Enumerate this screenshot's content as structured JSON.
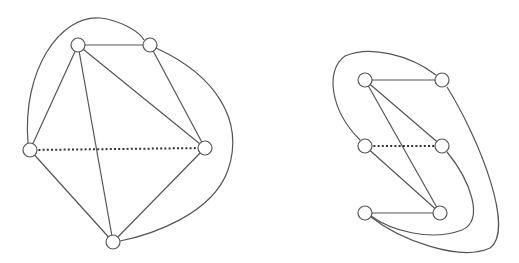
{
  "colors": {
    "edge": "#555555",
    "node_fill": "#ffffff",
    "dotted": "#333333",
    "background": "#ffffff"
  },
  "graphs": [
    {
      "name": "left-graph",
      "node_radius": 7,
      "nodes": [
        {
          "id": "a",
          "x": 78,
          "y": 45
        },
        {
          "id": "b",
          "x": 150,
          "y": 45
        },
        {
          "id": "c",
          "x": 30,
          "y": 150
        },
        {
          "id": "d",
          "x": 205,
          "y": 148
        },
        {
          "id": "e",
          "x": 113,
          "y": 242
        }
      ],
      "edges": [
        {
          "from": "a",
          "to": "b",
          "style": "solid"
        },
        {
          "from": "a",
          "to": "c",
          "style": "solid"
        },
        {
          "from": "a",
          "to": "d",
          "style": "solid"
        },
        {
          "from": "a",
          "to": "e",
          "style": "solid"
        },
        {
          "from": "b",
          "to": "d",
          "style": "solid"
        },
        {
          "from": "c",
          "to": "e",
          "style": "solid"
        },
        {
          "from": "d",
          "to": "e",
          "style": "solid"
        },
        {
          "from": "c",
          "to": "d",
          "style": "dotted"
        },
        {
          "from": "c",
          "to": "b",
          "style": "curve",
          "path": "M 28 143 C 22 70, 60 15, 100 18 C 120 20, 140 32, 144 40"
        },
        {
          "from": "b",
          "to": "e",
          "style": "curve",
          "path": "M 156 48 C 215 75, 245 120, 228 170 C 212 215, 150 235, 120 241"
        }
      ]
    },
    {
      "name": "right-graph",
      "node_radius": 7,
      "nodes": [
        {
          "id": "p",
          "x": 365,
          "y": 80
        },
        {
          "id": "q",
          "x": 442,
          "y": 80
        },
        {
          "id": "r",
          "x": 365,
          "y": 146
        },
        {
          "id": "s",
          "x": 442,
          "y": 146
        },
        {
          "id": "t",
          "x": 365,
          "y": 213
        },
        {
          "id": "u",
          "x": 440,
          "y": 213
        }
      ],
      "edges": [
        {
          "from": "p",
          "to": "q",
          "style": "solid"
        },
        {
          "from": "p",
          "to": "s",
          "style": "solid"
        },
        {
          "from": "p",
          "to": "u",
          "style": "solid"
        },
        {
          "from": "r",
          "to": "u",
          "style": "solid"
        },
        {
          "from": "t",
          "to": "u",
          "style": "solid"
        },
        {
          "from": "r",
          "to": "s",
          "style": "dotted"
        },
        {
          "from": "r",
          "to": "q",
          "style": "curve",
          "path": "M 360 140 C 330 110, 325 70, 345 56 C 370 45, 410 55, 436 75"
        },
        {
          "from": "s",
          "to": "t",
          "style": "curve",
          "path": "M 447 152 C 470 180, 485 220, 462 230 C 430 242, 390 230, 371 216"
        },
        {
          "from": "q",
          "to": "t",
          "style": "curve",
          "path": "M 447 87 C 480 140, 515 230, 490 248 C 460 262, 400 240, 371 217"
        }
      ]
    }
  ]
}
